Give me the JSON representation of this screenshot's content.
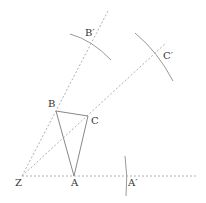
{
  "diagram": {
    "colors": {
      "line": "#888888",
      "dashed": "#b0b0b0",
      "arc": "#999999",
      "text": "#333333"
    },
    "points": {
      "Z": {
        "label": "Z",
        "x": 22,
        "y": 176
      },
      "A": {
        "label": "A",
        "x": 74,
        "y": 176
      },
      "B": {
        "label": "B",
        "x": 56,
        "y": 111
      },
      "C": {
        "label": "C",
        "x": 88,
        "y": 116
      },
      "A_prime": {
        "label": "A′",
        "x": 126,
        "y": 176
      },
      "B_prime": {
        "label": "B′",
        "x": 90,
        "y": 45
      },
      "C_prime": {
        "label": "C′",
        "x": 154,
        "y": 56
      }
    },
    "triangle": [
      "A",
      "B",
      "C"
    ],
    "rays": [
      {
        "from": "Z",
        "through": "A",
        "to": [
          198,
          176
        ]
      },
      {
        "from": "Z",
        "through": "B",
        "to": [
          108,
          11
        ]
      },
      {
        "from": "Z",
        "through": "C",
        "to": [
          166,
          43
        ]
      }
    ],
    "arcs": [
      {
        "near": "B_prime",
        "d": "M70 34 Q92 40 111 60"
      },
      {
        "near": "C_prime",
        "d": "M135 33 Q158 52 173 81"
      },
      {
        "near": "A_prime",
        "d": "M125 156 Q128 176 126 196"
      }
    ]
  }
}
